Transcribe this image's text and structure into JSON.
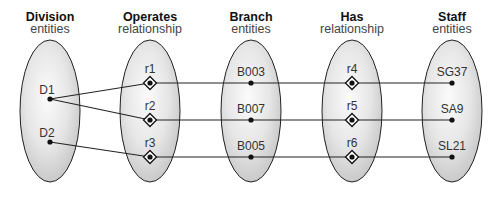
{
  "columns": [
    {
      "id": "division",
      "title": "Division",
      "subtitle": "entities",
      "cx": 50
    },
    {
      "id": "operates",
      "title": "Operates",
      "subtitle": "relationship",
      "cx": 150
    },
    {
      "id": "branch",
      "title": "Branch",
      "subtitle": "entities",
      "cx": 251
    },
    {
      "id": "has",
      "title": "Has",
      "subtitle": "relationship",
      "cx": 352
    },
    {
      "id": "staff",
      "title": "Staff",
      "subtitle": "entities",
      "cx": 452
    }
  ],
  "nodes": {
    "division": [
      {
        "label": "D1",
        "x": 50,
        "y": 99
      },
      {
        "label": "D2",
        "x": 50,
        "y": 142
      }
    ],
    "operates": [
      {
        "label": "r1",
        "x": 150,
        "y": 83
      },
      {
        "label": "r2",
        "x": 150,
        "y": 120
      },
      {
        "label": "r3",
        "x": 150,
        "y": 157
      }
    ],
    "branch": [
      {
        "label": "B003",
        "x": 251,
        "y": 83
      },
      {
        "label": "B007",
        "x": 251,
        "y": 120
      },
      {
        "label": "B005",
        "x": 251,
        "y": 157
      }
    ],
    "has": [
      {
        "label": "r4",
        "x": 352,
        "y": 83
      },
      {
        "label": "r5",
        "x": 352,
        "y": 120
      },
      {
        "label": "r6",
        "x": 352,
        "y": 157
      }
    ],
    "staff": [
      {
        "label": "SG37",
        "x": 452,
        "y": 83
      },
      {
        "label": "SA9",
        "x": 452,
        "y": 120
      },
      {
        "label": "SL21",
        "x": 452,
        "y": 157
      }
    ]
  },
  "links": [
    {
      "from": "D1",
      "to": "r1"
    },
    {
      "from": "D1",
      "to": "r2"
    },
    {
      "from": "D2",
      "to": "r3"
    },
    {
      "from": "r1",
      "to": "B003"
    },
    {
      "from": "r2",
      "to": "B007"
    },
    {
      "from": "r3",
      "to": "B005"
    },
    {
      "from": "B003",
      "to": "r4"
    },
    {
      "from": "B007",
      "to": "r5"
    },
    {
      "from": "B005",
      "to": "r6"
    },
    {
      "from": "r4",
      "to": "SG37"
    },
    {
      "from": "r5",
      "to": "SA9"
    },
    {
      "from": "r6",
      "to": "SL21"
    }
  ],
  "colors": {
    "ellipse_light": "#f7f7f7",
    "ellipse_dark": "#c8c8c8",
    "stroke": "#222222"
  }
}
